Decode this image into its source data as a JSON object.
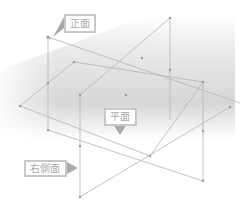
{
  "diagram": {
    "labels": {
      "front": "正面",
      "top": "平面",
      "right": "右側面"
    },
    "origin_tags": {
      "front": "Top",
      "top": "Top",
      "right": "Right"
    },
    "colors": {
      "line": "#b4b4b4",
      "point": "#9a9a9a",
      "callout_border": "#c8c8c8",
      "callout_text": "#a8a8a8",
      "shade": "#d4d4d4"
    }
  }
}
